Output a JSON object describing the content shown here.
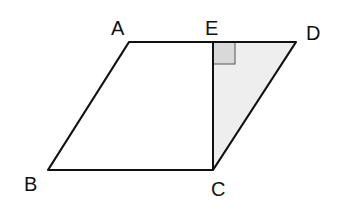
{
  "diagram": {
    "points": {
      "A": {
        "label": "A",
        "x": 129,
        "y": 42
      },
      "E": {
        "label": "E",
        "x": 213,
        "y": 42
      },
      "D": {
        "label": "D",
        "x": 296,
        "y": 42
      },
      "B": {
        "label": "B",
        "x": 48,
        "y": 170
      },
      "C": {
        "label": "C",
        "x": 213,
        "y": 170
      }
    },
    "shaded_region": "triangle ECD",
    "right_angle_at": "E",
    "colors": {
      "line": "#111111",
      "shade": "#eeeeee",
      "right_angle_fill": "#d9d9d9"
    }
  }
}
